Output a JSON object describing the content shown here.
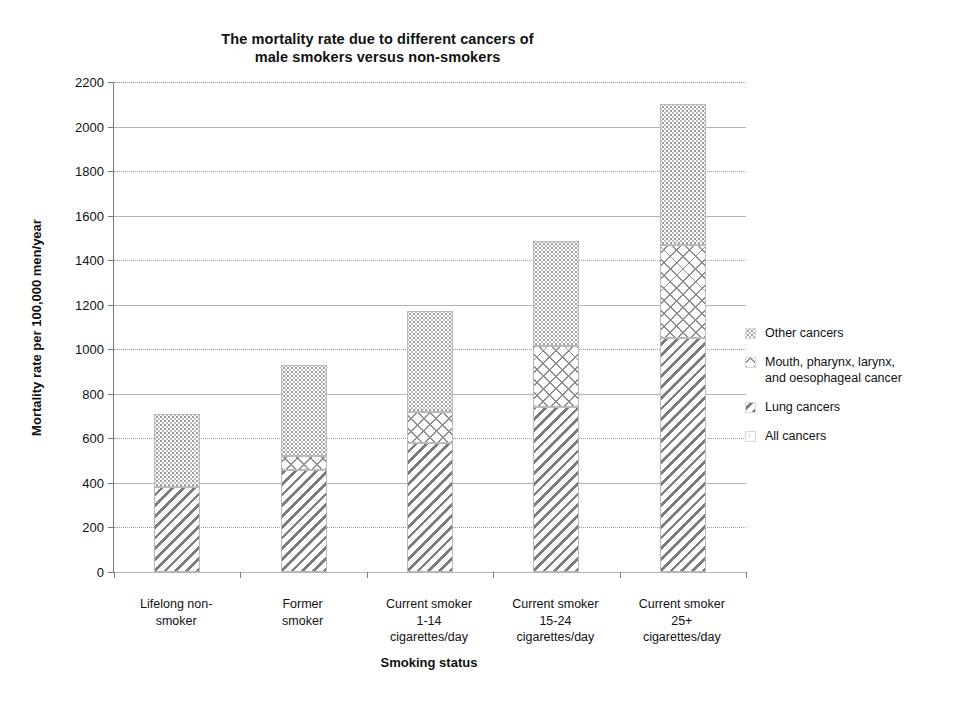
{
  "chart_data": {
    "type": "bar",
    "stacked": true,
    "title": "The mortality rate due to different cancers of\nmale smokers versus non-smokers",
    "xlabel": "Smoking status",
    "ylabel": "Mortality rate per 100,000 men/year",
    "ylim": [
      0,
      2200
    ],
    "ytick_step": 200,
    "yticks": [
      0,
      200,
      400,
      600,
      800,
      1000,
      1200,
      1400,
      1600,
      1800,
      2000,
      2200
    ],
    "grid": "horizontal",
    "legend_position": "right",
    "categories": [
      "Lifelong non-\nsmoker",
      "Former\nsmoker",
      "Current smoker\n1-14\ncigarettes/day",
      "Current smoker\n15-24\ncigarettes/day",
      "Current smoker\n25+\ncigarettes/day"
    ],
    "series": [
      {
        "name": "Lung cancers",
        "fill": "diagonal-hatch",
        "values": [
          380,
          460,
          580,
          740,
          1050
        ]
      },
      {
        "name": "Mouth, pharynx, larynx,\nand oesophageal cancer",
        "fill": "cross-hatch",
        "values": [
          0,
          60,
          140,
          275,
          420
        ]
      },
      {
        "name": "Other cancers",
        "fill": "dotted",
        "values": [
          330,
          410,
          450,
          470,
          630
        ]
      }
    ],
    "totals": [
      710,
      930,
      1170,
      1485,
      2100
    ],
    "legend_entries": [
      {
        "label": "Other cancers",
        "fill": "dotted"
      },
      {
        "label": "Mouth, pharynx, larynx,\nand oesophageal cancer",
        "fill": "cross-hatch"
      },
      {
        "label": "Lung cancers",
        "fill": "diagonal-hatch"
      },
      {
        "label": "All cancers",
        "fill": "sparse-speckle"
      }
    ]
  }
}
